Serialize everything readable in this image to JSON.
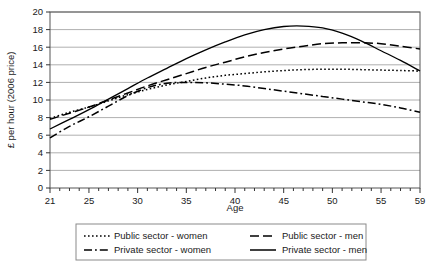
{
  "chart_data": {
    "type": "line",
    "title": "",
    "xlabel": "Age",
    "ylabel": "£ per hour (2006 price)",
    "xlim": [
      21,
      59
    ],
    "ylim": [
      0,
      20
    ],
    "ytick_step": 2,
    "grid": true,
    "legend_position": "bottom",
    "xticks": [
      21,
      25,
      30,
      35,
      40,
      45,
      50,
      55,
      59
    ],
    "xtick_labels": [
      "21",
      "25",
      "30",
      "35",
      "40",
      "45",
      "50",
      "55",
      "59"
    ],
    "yticks": [
      0,
      2,
      4,
      6,
      8,
      10,
      12,
      14,
      16,
      18,
      20
    ],
    "ytick_labels": [
      "0",
      "2",
      "4",
      "6",
      "8",
      "10",
      "12",
      "14",
      "16",
      "18",
      "20"
    ],
    "x": [
      21,
      23,
      25,
      27,
      29,
      31,
      33,
      35,
      37,
      39,
      41,
      43,
      45,
      47,
      49,
      51,
      53,
      55,
      57,
      59
    ],
    "series": [
      {
        "name": "Public sector - women",
        "style": "dotted",
        "color": "#000000",
        "values": [
          7.9,
          8.6,
          9.2,
          9.9,
          10.6,
          11.2,
          11.7,
          12.1,
          12.5,
          12.8,
          13.0,
          13.2,
          13.35,
          13.45,
          13.5,
          13.5,
          13.45,
          13.4,
          13.35,
          13.3
        ]
      },
      {
        "name": "Public sector - men",
        "style": "dashed",
        "color": "#000000",
        "values": [
          7.8,
          8.5,
          9.2,
          10.0,
          10.8,
          11.6,
          12.3,
          13.0,
          13.7,
          14.3,
          14.9,
          15.4,
          15.8,
          16.1,
          16.4,
          16.5,
          16.5,
          16.4,
          16.1,
          15.8
        ]
      },
      {
        "name": "Private sector - women",
        "style": "dashdot",
        "color": "#000000",
        "values": [
          5.7,
          7.0,
          8.1,
          9.3,
          10.5,
          11.4,
          11.9,
          12.0,
          11.95,
          11.8,
          11.6,
          11.3,
          11.0,
          10.7,
          10.4,
          10.1,
          9.8,
          9.5,
          9.1,
          8.6
        ]
      },
      {
        "name": "Private sector - men",
        "style": "solid",
        "color": "#000000",
        "values": [
          6.7,
          7.8,
          8.9,
          10.1,
          11.3,
          12.5,
          13.6,
          14.7,
          15.7,
          16.6,
          17.4,
          18.0,
          18.35,
          18.4,
          18.2,
          17.6,
          16.7,
          15.6,
          14.5,
          13.3
        ]
      }
    ]
  },
  "legend": {
    "items": [
      {
        "label": "Public sector - women",
        "style": "dotted"
      },
      {
        "label": "Public sector - men",
        "style": "dashed"
      },
      {
        "label": "Private sector - women",
        "style": "dashdot"
      },
      {
        "label": "Private sector - men",
        "style": "solid"
      }
    ]
  }
}
